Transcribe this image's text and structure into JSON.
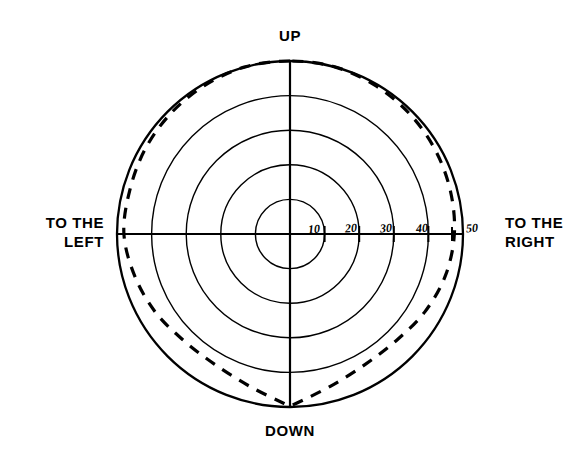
{
  "figure": {
    "kind": "polar-visual-field-plot",
    "background_color": "#ffffff",
    "line_color": "#000000"
  },
  "cardinal_labels": {
    "up": "UP",
    "down": "DOWN",
    "left": "TO THE\nLEFT",
    "right": "TO THE\nRIGHT"
  },
  "radial_tick_labels": [
    {
      "value": "10",
      "x": 308,
      "y": 222
    },
    {
      "value": "20",
      "x": 345,
      "y": 221
    },
    {
      "value": "30",
      "x": 380,
      "y": 221
    },
    {
      "value": "40",
      "x": 416,
      "y": 221
    },
    {
      "value": "50",
      "x": 466,
      "y": 221
    }
  ],
  "chart_data": {
    "type": "line",
    "coordinate_system": "polar",
    "title": "",
    "subtitle": "",
    "xlabel": "",
    "ylabel": "",
    "grid": true,
    "legend_position": "none",
    "center_px": [
      290,
      234
    ],
    "px_per_unit": 3.46,
    "radial_axis": {
      "label": "",
      "ticks": [
        10,
        20,
        30,
        40,
        50
      ],
      "rlim": [
        0,
        50
      ],
      "tick_circles_drawn": [
        10,
        20,
        30,
        40,
        50
      ],
      "outer_boundary": 50
    },
    "angular_axis": {
      "labels": [
        "UP",
        "TO THE RIGHT",
        "DOWN",
        "TO THE LEFT"
      ],
      "label_angles_deg": [
        90,
        0,
        270,
        180
      ],
      "axes_drawn_deg": [
        0,
        90,
        180,
        270
      ]
    },
    "series": [
      {
        "name": "visual field boundary",
        "style": "dashed",
        "closed": true,
        "units": "degrees of visual angle",
        "points": [
          {
            "angle_deg": 90,
            "radius": 50
          },
          {
            "angle_deg": 105,
            "radius": 50
          },
          {
            "angle_deg": 120,
            "radius": 49.5
          },
          {
            "angle_deg": 135,
            "radius": 49
          },
          {
            "angle_deg": 150,
            "radius": 48.5
          },
          {
            "angle_deg": 165,
            "radius": 48
          },
          {
            "angle_deg": 180,
            "radius": 48
          },
          {
            "angle_deg": 195,
            "radius": 46.5
          },
          {
            "angle_deg": 210,
            "radius": 45
          },
          {
            "angle_deg": 225,
            "radius": 43.5
          },
          {
            "angle_deg": 240,
            "radius": 43.5
          },
          {
            "angle_deg": 255,
            "radius": 45.5
          },
          {
            "angle_deg": 268,
            "radius": 49
          },
          {
            "angle_deg": 270,
            "radius": 49.5
          },
          {
            "angle_deg": 272,
            "radius": 49
          },
          {
            "angle_deg": 285,
            "radius": 45.5
          },
          {
            "angle_deg": 300,
            "radius": 43.5
          },
          {
            "angle_deg": 315,
            "radius": 43.5
          },
          {
            "angle_deg": 330,
            "radius": 45
          },
          {
            "angle_deg": 345,
            "radius": 46.5
          },
          {
            "angle_deg": 360,
            "radius": 47.5
          },
          {
            "angle_deg": 15,
            "radius": 48
          },
          {
            "angle_deg": 30,
            "radius": 48.5
          },
          {
            "angle_deg": 45,
            "radius": 49
          },
          {
            "angle_deg": 60,
            "radius": 49.5
          },
          {
            "angle_deg": 75,
            "radius": 50
          }
        ]
      }
    ]
  }
}
